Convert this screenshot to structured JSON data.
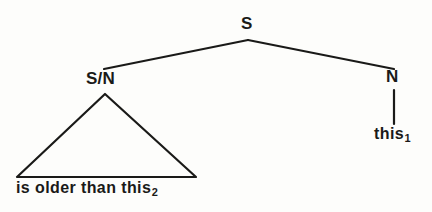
{
  "diagram": {
    "type": "syntax-tree",
    "title": "",
    "background_color": "#fdfdfb",
    "stroke_color": "#1a1a18",
    "text_color": "#1a1a18",
    "root": {
      "label": "S"
    },
    "nodes": {
      "root_label": "S",
      "left_child_label": "S/N",
      "right_child_label": "N",
      "right_leaf_text": "this",
      "right_leaf_subscript": "1",
      "triangle_leaf_text": "is older than this",
      "triangle_leaf_subscript": "2"
    },
    "sentence": "is older than this₂ this₁",
    "notes": {
      "triangle_meaning": "elided constituent structure",
      "subscripts": [
        "1",
        "2"
      ]
    }
  }
}
